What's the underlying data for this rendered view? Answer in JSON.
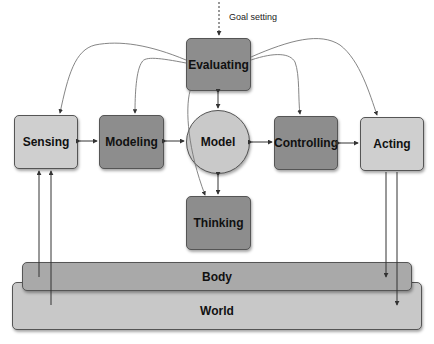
{
  "diagram": {
    "goal_label": "Goal setting",
    "nodes": {
      "evaluating": "Evaluating",
      "sensing": "Sensing",
      "modeling": "Modeling",
      "model": "Model",
      "controlling": "Controlling",
      "acting": "Acting",
      "thinking": "Thinking"
    },
    "layers": {
      "body": "Body",
      "world": "World"
    },
    "edges": [
      {
        "from": "goal",
        "to": "evaluating",
        "style": "dashed"
      },
      {
        "from": "evaluating",
        "to": "sensing",
        "style": "curved"
      },
      {
        "from": "evaluating",
        "to": "modeling",
        "style": "curved"
      },
      {
        "from": "evaluating",
        "to": "controlling",
        "style": "curved"
      },
      {
        "from": "evaluating",
        "to": "acting",
        "style": "curved"
      },
      {
        "from": "evaluating",
        "to": "model",
        "style": "bidirectional"
      },
      {
        "from": "sensing",
        "to": "modeling",
        "style": "bidirectional"
      },
      {
        "from": "modeling",
        "to": "model",
        "style": "bidirectional"
      },
      {
        "from": "model",
        "to": "controlling",
        "style": "bidirectional"
      },
      {
        "from": "controlling",
        "to": "acting",
        "style": "bidirectional"
      },
      {
        "from": "model",
        "to": "thinking",
        "style": "bidirectional"
      },
      {
        "from": "evaluating",
        "to": "thinking",
        "style": "curved"
      },
      {
        "from": "body",
        "to": "sensing",
        "style": "straight"
      },
      {
        "from": "world",
        "to": "sensing",
        "style": "straight"
      },
      {
        "from": "acting",
        "to": "body",
        "style": "straight"
      },
      {
        "from": "acting",
        "to": "world",
        "style": "straight"
      }
    ],
    "colors": {
      "light_node": "#cfcfcf",
      "dark_node": "#8d8d8d",
      "body": "#a9a9a9",
      "world": "#c8c8c8"
    }
  }
}
